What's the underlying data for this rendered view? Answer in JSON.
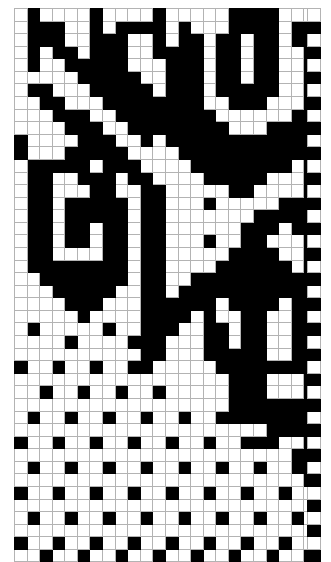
{
  "document": {
    "kind": "pattern-chart",
    "title": "Knitting Pattern Chart",
    "description": "Two-color grid chart: 24 columns by 44 rows, plus a separate single-column selvedge strip of 44 alternating cells."
  },
  "legend": {
    "filled_label": "filled",
    "empty_label": "empty",
    "filled_color": "#000000",
    "empty_color": "#ffffff",
    "gridline_color": "#b3b3b3"
  },
  "chart_data": {
    "type": "heatmap",
    "subtitle": "",
    "xlabel": "",
    "ylabel": "",
    "columns": 24,
    "rows": 44,
    "grid": true,
    "legend_position": "none",
    "value_map": {
      "0": "empty",
      "1": "filled"
    },
    "colors": {
      "0": "#ffffff",
      "1": "#000000"
    },
    "categories": [
      "1",
      "2",
      "3",
      "4",
      "5",
      "6",
      "7",
      "8",
      "9",
      "10",
      "11",
      "12",
      "13",
      "14",
      "15",
      "16",
      "17",
      "18",
      "19",
      "20",
      "21",
      "22",
      "23",
      "24"
    ],
    "row_labels": [
      "1",
      "2",
      "3",
      "4",
      "5",
      "6",
      "7",
      "8",
      "9",
      "10",
      "11",
      "12",
      "13",
      "14",
      "15",
      "16",
      "17",
      "18",
      "19",
      "20",
      "21",
      "22",
      "23",
      "24",
      "25",
      "26",
      "27",
      "28",
      "29",
      "30",
      "31",
      "32",
      "33",
      "34",
      "35",
      "36",
      "37",
      "38",
      "39",
      "40",
      "41",
      "42",
      "43",
      "44"
    ],
    "matrix": [
      [
        0,
        1,
        0,
        0,
        0,
        0,
        1,
        0,
        0,
        0,
        0,
        1,
        0,
        0,
        0,
        0,
        0,
        1,
        1,
        1,
        1,
        0,
        0,
        0
      ],
      [
        0,
        1,
        1,
        1,
        0,
        0,
        1,
        0,
        1,
        1,
        1,
        1,
        0,
        1,
        0,
        0,
        0,
        1,
        1,
        1,
        1,
        0,
        1,
        1
      ],
      [
        0,
        1,
        1,
        1,
        0,
        0,
        1,
        1,
        1,
        0,
        0,
        1,
        0,
        1,
        1,
        0,
        1,
        1,
        0,
        1,
        1,
        0,
        1,
        1
      ],
      [
        0,
        1,
        0,
        1,
        1,
        0,
        1,
        1,
        1,
        0,
        0,
        1,
        1,
        1,
        1,
        0,
        1,
        1,
        0,
        1,
        1,
        0,
        0,
        1
      ],
      [
        0,
        1,
        0,
        0,
        1,
        1,
        1,
        1,
        1,
        0,
        0,
        0,
        1,
        1,
        1,
        0,
        1,
        1,
        0,
        1,
        1,
        0,
        0,
        1
      ],
      [
        0,
        0,
        0,
        0,
        0,
        1,
        1,
        1,
        1,
        1,
        0,
        0,
        1,
        1,
        1,
        0,
        1,
        1,
        0,
        1,
        1,
        0,
        0,
        1
      ],
      [
        0,
        1,
        1,
        0,
        0,
        0,
        1,
        1,
        1,
        1,
        1,
        0,
        1,
        1,
        1,
        0,
        1,
        1,
        1,
        1,
        1,
        0,
        0,
        1
      ],
      [
        0,
        0,
        1,
        1,
        0,
        0,
        0,
        1,
        1,
        1,
        1,
        1,
        1,
        1,
        1,
        0,
        0,
        1,
        1,
        1,
        0,
        0,
        0,
        1
      ],
      [
        0,
        0,
        0,
        1,
        1,
        1,
        0,
        0,
        1,
        1,
        1,
        1,
        1,
        1,
        1,
        1,
        0,
        0,
        0,
        0,
        0,
        0,
        1,
        1
      ],
      [
        0,
        0,
        0,
        0,
        1,
        1,
        1,
        0,
        0,
        1,
        1,
        1,
        1,
        1,
        1,
        1,
        1,
        0,
        0,
        0,
        1,
        1,
        1,
        1
      ],
      [
        1,
        0,
        0,
        0,
        0,
        1,
        1,
        1,
        0,
        0,
        1,
        0,
        1,
        1,
        1,
        1,
        1,
        1,
        1,
        1,
        1,
        1,
        1,
        1
      ],
      [
        1,
        0,
        0,
        0,
        1,
        1,
        1,
        1,
        1,
        0,
        0,
        0,
        0,
        1,
        1,
        1,
        1,
        1,
        1,
        1,
        1,
        1,
        1,
        1
      ],
      [
        0,
        1,
        1,
        1,
        1,
        1,
        0,
        1,
        1,
        1,
        0,
        0,
        0,
        0,
        1,
        1,
        1,
        1,
        1,
        1,
        1,
        1,
        0,
        1
      ],
      [
        0,
        1,
        1,
        0,
        0,
        1,
        1,
        1,
        0,
        1,
        1,
        0,
        0,
        0,
        0,
        1,
        1,
        1,
        1,
        1,
        0,
        0,
        0,
        1
      ],
      [
        0,
        1,
        1,
        0,
        0,
        0,
        1,
        1,
        0,
        0,
        1,
        1,
        0,
        0,
        0,
        0,
        0,
        1,
        1,
        0,
        0,
        0,
        0,
        1
      ],
      [
        0,
        1,
        1,
        0,
        1,
        1,
        1,
        1,
        1,
        0,
        1,
        1,
        0,
        0,
        0,
        1,
        0,
        0,
        0,
        0,
        0,
        1,
        1,
        1
      ],
      [
        0,
        1,
        1,
        0,
        1,
        1,
        1,
        1,
        1,
        0,
        1,
        1,
        0,
        0,
        0,
        0,
        0,
        0,
        0,
        1,
        1,
        1,
        1,
        1
      ],
      [
        0,
        1,
        1,
        0,
        1,
        1,
        0,
        1,
        1,
        0,
        1,
        1,
        0,
        0,
        0,
        0,
        0,
        0,
        1,
        1,
        1,
        0,
        1,
        1
      ],
      [
        0,
        1,
        1,
        0,
        1,
        1,
        0,
        1,
        1,
        0,
        1,
        1,
        0,
        0,
        0,
        1,
        0,
        0,
        1,
        1,
        0,
        0,
        0,
        1
      ],
      [
        0,
        1,
        1,
        0,
        0,
        0,
        0,
        1,
        1,
        0,
        1,
        1,
        0,
        0,
        0,
        0,
        0,
        1,
        1,
        1,
        1,
        0,
        0,
        1
      ],
      [
        0,
        1,
        1,
        1,
        1,
        1,
        1,
        1,
        1,
        0,
        1,
        1,
        0,
        0,
        0,
        0,
        1,
        1,
        1,
        1,
        1,
        1,
        0,
        1
      ],
      [
        0,
        0,
        1,
        1,
        1,
        1,
        1,
        1,
        1,
        0,
        1,
        1,
        0,
        0,
        1,
        1,
        1,
        1,
        1,
        1,
        1,
        1,
        1,
        1
      ],
      [
        0,
        0,
        0,
        1,
        1,
        1,
        1,
        1,
        0,
        0,
        1,
        1,
        0,
        1,
        1,
        1,
        1,
        1,
        1,
        1,
        1,
        1,
        1,
        1
      ],
      [
        0,
        0,
        0,
        0,
        1,
        1,
        1,
        0,
        0,
        0,
        1,
        1,
        1,
        1,
        1,
        1,
        0,
        1,
        1,
        1,
        1,
        0,
        1,
        1
      ],
      [
        0,
        0,
        0,
        0,
        0,
        1,
        0,
        0,
        0,
        0,
        1,
        1,
        1,
        1,
        0,
        1,
        0,
        0,
        1,
        1,
        0,
        0,
        1,
        1
      ],
      [
        0,
        1,
        0,
        0,
        0,
        0,
        0,
        1,
        0,
        0,
        1,
        1,
        1,
        0,
        0,
        1,
        1,
        0,
        1,
        1,
        0,
        0,
        1,
        1
      ],
      [
        0,
        0,
        0,
        0,
        1,
        0,
        0,
        0,
        0,
        1,
        1,
        1,
        0,
        0,
        0,
        1,
        1,
        0,
        1,
        1,
        0,
        0,
        1,
        1
      ],
      [
        0,
        0,
        0,
        0,
        0,
        0,
        0,
        0,
        0,
        0,
        1,
        1,
        0,
        0,
        0,
        1,
        1,
        1,
        1,
        1,
        0,
        0,
        1,
        1
      ],
      [
        1,
        0,
        0,
        1,
        0,
        0,
        1,
        0,
        0,
        1,
        1,
        0,
        0,
        0,
        0,
        0,
        1,
        1,
        1,
        1,
        1,
        1,
        1,
        1
      ],
      [
        0,
        0,
        0,
        0,
        0,
        0,
        0,
        0,
        0,
        0,
        0,
        0,
        0,
        0,
        0,
        0,
        0,
        1,
        1,
        1,
        0,
        0,
        0,
        1
      ],
      [
        0,
        0,
        1,
        0,
        0,
        1,
        0,
        0,
        1,
        0,
        0,
        1,
        0,
        0,
        0,
        0,
        0,
        1,
        1,
        1,
        0,
        0,
        0,
        1
      ],
      [
        0,
        0,
        0,
        0,
        0,
        0,
        0,
        0,
        0,
        0,
        0,
        0,
        0,
        0,
        0,
        0,
        0,
        1,
        1,
        1,
        1,
        1,
        1,
        1
      ],
      [
        0,
        1,
        0,
        0,
        1,
        0,
        0,
        1,
        0,
        0,
        1,
        0,
        0,
        1,
        0,
        0,
        1,
        1,
        1,
        1,
        1,
        1,
        1,
        1
      ],
      [
        0,
        0,
        0,
        0,
        0,
        0,
        0,
        0,
        0,
        0,
        0,
        0,
        0,
        0,
        0,
        0,
        0,
        0,
        0,
        0,
        1,
        1,
        1,
        1
      ],
      [
        1,
        0,
        0,
        1,
        0,
        0,
        1,
        0,
        0,
        1,
        0,
        0,
        1,
        0,
        0,
        1,
        0,
        0,
        1,
        1,
        1,
        0,
        0,
        1
      ],
      [
        0,
        0,
        0,
        0,
        0,
        0,
        0,
        0,
        0,
        0,
        0,
        0,
        0,
        0,
        0,
        0,
        0,
        0,
        0,
        0,
        0,
        0,
        1,
        1
      ],
      [
        0,
        1,
        0,
        0,
        1,
        0,
        0,
        1,
        0,
        0,
        1,
        0,
        0,
        1,
        0,
        0,
        1,
        0,
        0,
        1,
        0,
        0,
        1,
        1
      ],
      [
        0,
        0,
        0,
        0,
        0,
        0,
        0,
        0,
        0,
        0,
        0,
        0,
        0,
        0,
        0,
        0,
        0,
        0,
        0,
        0,
        0,
        0,
        0,
        1
      ],
      [
        1,
        0,
        0,
        1,
        0,
        0,
        1,
        0,
        0,
        1,
        0,
        0,
        1,
        0,
        0,
        1,
        0,
        0,
        1,
        0,
        0,
        1,
        0,
        0
      ],
      [
        0,
        0,
        0,
        0,
        0,
        0,
        0,
        0,
        0,
        0,
        0,
        0,
        0,
        0,
        0,
        0,
        0,
        0,
        0,
        0,
        0,
        0,
        0,
        0
      ],
      [
        0,
        1,
        0,
        0,
        1,
        0,
        0,
        1,
        0,
        0,
        1,
        0,
        0,
        1,
        0,
        0,
        1,
        0,
        0,
        1,
        0,
        0,
        1,
        0
      ],
      [
        0,
        0,
        0,
        0,
        0,
        0,
        0,
        0,
        0,
        0,
        0,
        0,
        0,
        0,
        0,
        0,
        0,
        0,
        0,
        0,
        0,
        0,
        0,
        0
      ],
      [
        1,
        0,
        0,
        1,
        0,
        0,
        1,
        0,
        0,
        1,
        0,
        0,
        1,
        0,
        0,
        1,
        0,
        0,
        1,
        0,
        0,
        1,
        0,
        0
      ],
      [
        0,
        0,
        1,
        0,
        0,
        1,
        0,
        0,
        1,
        0,
        0,
        1,
        0,
        0,
        1,
        0,
        0,
        1,
        0,
        0,
        1,
        0,
        0,
        1
      ]
    ]
  },
  "selvedge": {
    "label": "selvedge strip",
    "columns": 1,
    "rows": 44,
    "matrix": [
      [
        0
      ],
      [
        1
      ],
      [
        0
      ],
      [
        1
      ],
      [
        0
      ],
      [
        1
      ],
      [
        0
      ],
      [
        1
      ],
      [
        0
      ],
      [
        1
      ],
      [
        0
      ],
      [
        1
      ],
      [
        0
      ],
      [
        1
      ],
      [
        0
      ],
      [
        1
      ],
      [
        0
      ],
      [
        1
      ],
      [
        0
      ],
      [
        1
      ],
      [
        0
      ],
      [
        1
      ],
      [
        0
      ],
      [
        1
      ],
      [
        0
      ],
      [
        1
      ],
      [
        0
      ],
      [
        1
      ],
      [
        0
      ],
      [
        1
      ],
      [
        0
      ],
      [
        1
      ],
      [
        0
      ],
      [
        1
      ],
      [
        0
      ],
      [
        1
      ],
      [
        0
      ],
      [
        1
      ],
      [
        0
      ],
      [
        1
      ],
      [
        0
      ],
      [
        1
      ],
      [
        0
      ],
      [
        1
      ]
    ]
  }
}
